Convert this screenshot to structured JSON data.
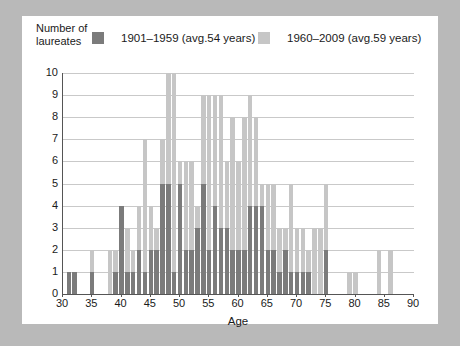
{
  "figure": {
    "background_color": "#b9b9b9",
    "panel_color": "#ffffff"
  },
  "axis_title_y": "Number of\nlaureates",
  "legend": {
    "entries": [
      {
        "label": "1901–1959 (avg.54 years)",
        "color": "#7b7b7b",
        "name": "legend-series-1901-1959"
      },
      {
        "label": "1960–2009 (avg.59 years)",
        "color": "#c6c6c6",
        "name": "legend-series-1960-2009"
      }
    ]
  },
  "chart_data": {
    "type": "bar",
    "title": "",
    "subtitle": "",
    "xlabel": "Age",
    "ylabel": "Number of laureates",
    "xlim": [
      30,
      90
    ],
    "ylim": [
      0,
      10
    ],
    "grid": true,
    "legend_position": "top",
    "stacked": true,
    "bar_width_years": 1,
    "xticks": [
      30,
      35,
      40,
      45,
      50,
      55,
      60,
      65,
      70,
      75,
      80,
      85,
      90
    ],
    "yticks": [
      0,
      1,
      2,
      3,
      4,
      5,
      6,
      7,
      8,
      9,
      10
    ],
    "x": [
      31,
      32,
      33,
      34,
      35,
      36,
      37,
      38,
      39,
      40,
      41,
      42,
      43,
      44,
      45,
      46,
      47,
      48,
      49,
      50,
      51,
      52,
      53,
      54,
      55,
      56,
      57,
      58,
      59,
      60,
      61,
      62,
      63,
      64,
      65,
      66,
      67,
      68,
      69,
      70,
      71,
      72,
      73,
      74,
      75,
      76,
      77,
      78,
      79,
      80,
      81,
      82,
      83,
      84,
      85,
      86,
      87,
      88
    ],
    "series": [
      {
        "name": "1901–1959 (avg.54 years)",
        "color": "#7b7b7b",
        "values": [
          1,
          1,
          0,
          0,
          1,
          0,
          0,
          0,
          1,
          4,
          1,
          1,
          2,
          1,
          2,
          2,
          5,
          5,
          1,
          5,
          2,
          2,
          3,
          5,
          2,
          4,
          3,
          3,
          2,
          2,
          2,
          4,
          4,
          4,
          2,
          2,
          1,
          2,
          1,
          1,
          1,
          1,
          0,
          0,
          2,
          0,
          0,
          0,
          0,
          0,
          0,
          0,
          0,
          0,
          0,
          0,
          0,
          0
        ]
      },
      {
        "name": "1960–2009 (avg.59 years)",
        "color": "#c6c6c6",
        "values": [
          0,
          0,
          0,
          0,
          1,
          0,
          0,
          2,
          1,
          0,
          2,
          1,
          2,
          6,
          2,
          1,
          2,
          5,
          9,
          1,
          4,
          4,
          1,
          4,
          7,
          5,
          6,
          3,
          6,
          4,
          6,
          5,
          4,
          1,
          3,
          3,
          2,
          1,
          4,
          2,
          2,
          1,
          3,
          3,
          3,
          0,
          0,
          0,
          1,
          1,
          0,
          0,
          0,
          2,
          0,
          2,
          0,
          0
        ]
      }
    ]
  }
}
